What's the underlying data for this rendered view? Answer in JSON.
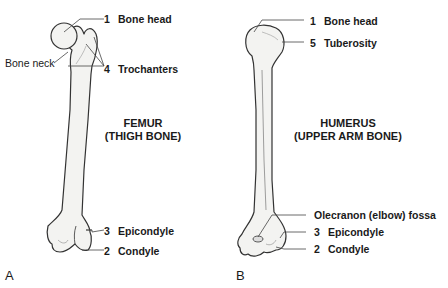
{
  "panels": [
    {
      "letter": "A",
      "title_line1": "FEMUR",
      "title_line2": "(THIGH BONE)",
      "labels": [
        {
          "num": "1",
          "text": "Bone head"
        },
        {
          "num": "4",
          "text": "Trochanters"
        },
        {
          "num": "3",
          "text": "Epicondyle"
        },
        {
          "num": "2",
          "text": "Condyle"
        }
      ],
      "unnumbered": "Bone neck"
    },
    {
      "letter": "B",
      "title_line1": "HUMERUS",
      "title_line2": "(UPPER ARM BONE)",
      "labels": [
        {
          "num": "1",
          "text": "Bone head"
        },
        {
          "num": "5",
          "text": "Tuberosity"
        },
        {
          "num": "",
          "text": "Olecranon (elbow) fossa"
        },
        {
          "num": "3",
          "text": "Epicondyle"
        },
        {
          "num": "2",
          "text": "Condyle"
        }
      ]
    }
  ],
  "colors": {
    "bone_fill": "#f3f3f1",
    "outline": "#333333",
    "leader": "#444444",
    "text": "#1a1a1a"
  }
}
